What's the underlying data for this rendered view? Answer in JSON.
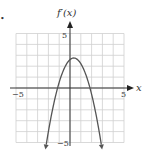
{
  "figure": {
    "bullet": "•",
    "y_axis_label": "f′(x)",
    "x_axis_label": "x",
    "tick_labels": {
      "y_top": "5",
      "y_bottom": "−5",
      "x_left": "−5",
      "x_right": "5"
    },
    "colors": {
      "grid": "#cfcfcf",
      "axis": "#333333",
      "curve": "#555555",
      "text": "#333333"
    }
  },
  "chart_data": {
    "type": "line",
    "title": "",
    "xlabel": "x",
    "ylabel": "f′(x)",
    "xlim": [
      -5,
      5
    ],
    "ylim": [
      -5,
      5
    ],
    "grid": true,
    "grid_step": 1,
    "legend": null,
    "series": [
      {
        "name": "f′(x)",
        "shape": "downward parabola with arrows at both ends",
        "vertex": [
          0.35,
          2.75
        ],
        "roots": [
          -1.15,
          1.85
        ],
        "x": [
          -2.2,
          -2.0,
          -1.5,
          -1.15,
          -1.0,
          -0.5,
          0.0,
          0.35,
          0.5,
          1.0,
          1.5,
          1.85,
          2.0,
          2.5,
          2.9
        ],
        "y": [
          -5.0,
          -4.1,
          -2.2,
          0.0,
          0.5,
          1.9,
          2.6,
          2.75,
          2.7,
          2.2,
          1.1,
          0.0,
          -0.6,
          -2.8,
          -5.0
        ]
      }
    ],
    "tick_labels": {
      "x": [
        "−5",
        "5"
      ],
      "y": [
        "−5",
        "5"
      ]
    }
  }
}
